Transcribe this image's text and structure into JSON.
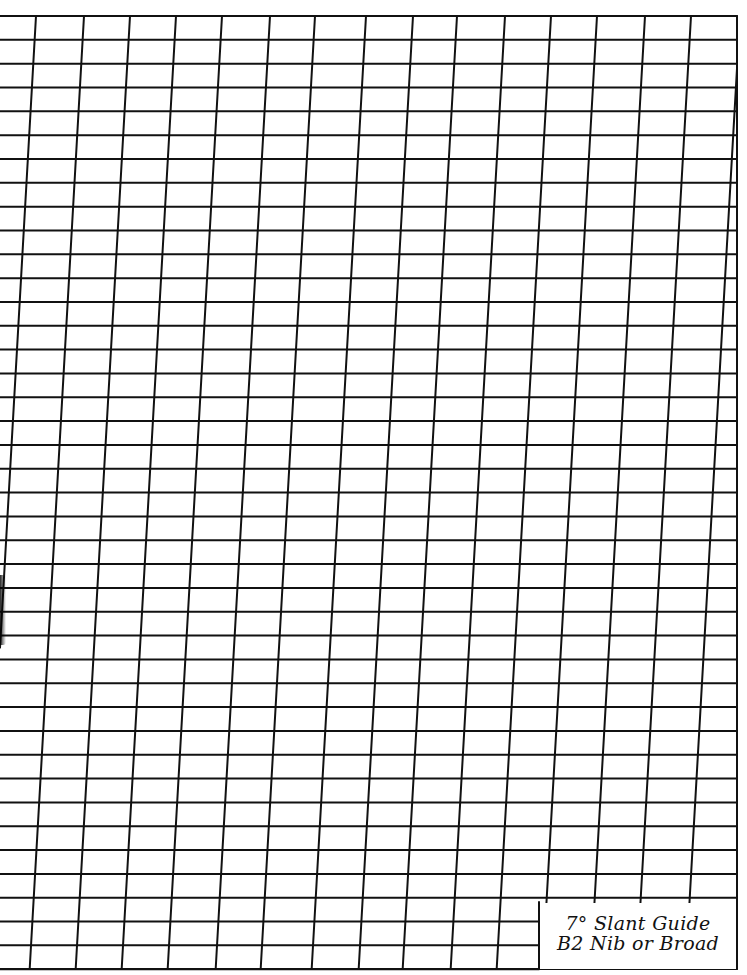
{
  "sheet": {
    "title": "7° Slant Guide",
    "subtitle": "B2 Nib or Broad",
    "slant_degrees": 7,
    "line_color": "#111111",
    "background": "#ffffff"
  },
  "grid": {
    "left": 0,
    "right": 737,
    "top": 16,
    "bottom": 969,
    "horizontal_line_count": 41,
    "horizontal_spacing": 23.83,
    "vertical_top_x": [
      36,
      84,
      130,
      176,
      222,
      270,
      315,
      366,
      413,
      457,
      505,
      551,
      597,
      645,
      691,
      740
    ],
    "vertical_slope": 0.057,
    "stroke_width": 2
  },
  "label_box": {
    "line1": "7° Slant Guide",
    "line2": "B2 Nib or Broad",
    "left": 539,
    "top": 902
  }
}
